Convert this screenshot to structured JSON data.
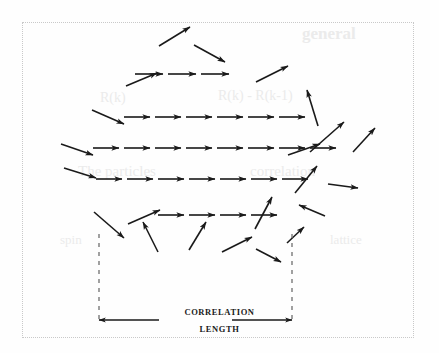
{
  "figure": {
    "kind": "spin-alignment-correlation-length-diagram",
    "border_color": "#c9c9c9",
    "ink_color": "#1a1a1a",
    "background_color": "#fefefe",
    "frame": {
      "x": 22,
      "y": 22,
      "width": 392,
      "height": 316
    },
    "labels": {
      "correlation": "CORRELATION",
      "length": "LENGTH"
    },
    "dimension_line": {
      "y": 320,
      "left_tip_x": 99,
      "left_tail_x": 159,
      "right_tail_x": 232,
      "right_tip_x": 292
    },
    "bracket": {
      "left_x": 99,
      "right_x": 292,
      "top_y": 234,
      "bottom_y": 320,
      "style": "dashed"
    },
    "aligned_rows": [
      {
        "name": "row-1",
        "y": 74,
        "x_start": 135,
        "count": 3,
        "seg": 33
      },
      {
        "name": "row-2",
        "y": 117,
        "x_start": 124,
        "count": 6,
        "seg": 31
      },
      {
        "name": "row-3",
        "y": 148,
        "x_start": 93,
        "count": 8,
        "seg": 31
      },
      {
        "name": "row-4",
        "y": 179,
        "x_start": 96,
        "count": 7,
        "seg": 31
      },
      {
        "name": "row-5",
        "y": 215,
        "x_start": 158,
        "count": 4,
        "seg": 31
      }
    ],
    "scattered_arrows": [
      {
        "name": "arrow-top-1",
        "x1": 159,
        "y1": 46,
        "x2": 190,
        "y2": 27
      },
      {
        "name": "arrow-top-2",
        "x1": 194,
        "y1": 45,
        "x2": 225,
        "y2": 62
      },
      {
        "name": "arrow-row1-left",
        "x1": 126,
        "y1": 86,
        "x2": 157,
        "y2": 73
      },
      {
        "name": "arrow-row1-right",
        "x1": 256,
        "y1": 82,
        "x2": 288,
        "y2": 66
      },
      {
        "name": "arrow-upper-right",
        "x1": 318,
        "y1": 126,
        "x2": 307,
        "y2": 90
      },
      {
        "name": "arrow-row2-left",
        "x1": 92,
        "y1": 110,
        "x2": 124,
        "y2": 124
      },
      {
        "name": "arrow-row3-left",
        "x1": 61,
        "y1": 144,
        "x2": 93,
        "y2": 155
      },
      {
        "name": "arrow-row3-right",
        "x1": 288,
        "y1": 155,
        "x2": 320,
        "y2": 144
      },
      {
        "name": "arrow-right-up-1",
        "x1": 310,
        "y1": 152,
        "x2": 344,
        "y2": 122
      },
      {
        "name": "arrow-right-up-2",
        "x1": 353,
        "y1": 152,
        "x2": 375,
        "y2": 128
      },
      {
        "name": "arrow-row4-left",
        "x1": 64,
        "y1": 168,
        "x2": 96,
        "y2": 178
      },
      {
        "name": "arrow-row4-right",
        "x1": 295,
        "y1": 193,
        "x2": 317,
        "y2": 166
      },
      {
        "name": "arrow-mid-right",
        "x1": 328,
        "y1": 184,
        "x2": 358,
        "y2": 188
      },
      {
        "name": "arrow-row5-left",
        "x1": 128,
        "y1": 224,
        "x2": 160,
        "y2": 210
      },
      {
        "name": "arrow-row5-up",
        "x1": 255,
        "y1": 229,
        "x2": 272,
        "y2": 197
      },
      {
        "name": "arrow-right-in",
        "x1": 325,
        "y1": 216,
        "x2": 299,
        "y2": 205
      },
      {
        "name": "arrow-low-1",
        "x1": 94,
        "y1": 212,
        "x2": 124,
        "y2": 238
      },
      {
        "name": "arrow-low-2",
        "x1": 158,
        "y1": 252,
        "x2": 143,
        "y2": 222
      },
      {
        "name": "arrow-low-3",
        "x1": 189,
        "y1": 250,
        "x2": 206,
        "y2": 222
      },
      {
        "name": "arrow-low-4",
        "x1": 222,
        "y1": 252,
        "x2": 252,
        "y2": 237
      },
      {
        "name": "arrow-low-5",
        "x1": 256,
        "y1": 249,
        "x2": 281,
        "y2": 262
      },
      {
        "name": "arrow-low-6",
        "x1": 287,
        "y1": 243,
        "x2": 304,
        "y2": 227
      }
    ]
  },
  "bleed_text": [
    {
      "name": "bleed-heading",
      "text": "general",
      "x": 302,
      "y": 24,
      "size": 17,
      "weight": "bold"
    },
    {
      "name": "bleed-formula-1",
      "text": "R(k) - R(k-1)",
      "x": 218,
      "y": 88,
      "size": 14,
      "weight": "normal"
    },
    {
      "name": "bleed-formula-2",
      "text": "R(k)",
      "x": 100,
      "y": 90,
      "size": 14,
      "weight": "normal"
    },
    {
      "name": "bleed-line-1",
      "text": "The particles",
      "x": 78,
      "y": 163,
      "size": 15,
      "weight": "normal"
    },
    {
      "name": "bleed-line-2",
      "text": "correlation",
      "x": 250,
      "y": 163,
      "size": 15,
      "weight": "normal"
    },
    {
      "name": "bleed-line-3",
      "text": "spin",
      "x": 60,
      "y": 232,
      "size": 13,
      "weight": "normal"
    },
    {
      "name": "bleed-line-4",
      "text": "lattice",
      "x": 330,
      "y": 232,
      "size": 13,
      "weight": "normal"
    }
  ]
}
